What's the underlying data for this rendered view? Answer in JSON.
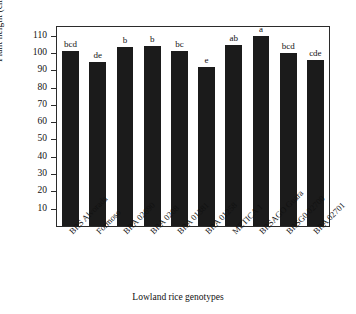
{
  "chart_data": {
    "type": "bar",
    "title": "",
    "xlabel": "Lowland rice genotypes",
    "ylabel": "Plant height (cm)",
    "ylim": [
      0,
      115
    ],
    "yticks": [
      10,
      20,
      30,
      40,
      50,
      60,
      70,
      80,
      90,
      100,
      110
    ],
    "grid": false,
    "legend": "none",
    "bar_color": "#1b1b1b",
    "categories": [
      "BRS Alvorada",
      "Formoso",
      "BRA 02690",
      "BRA 0208",
      "BRA 01381",
      "BRA 01258",
      "METICA 1",
      "BRSAGO Guara",
      "BRSG0 02700",
      "BRA 02701"
    ],
    "values": [
      101,
      95,
      103.5,
      104,
      101,
      92,
      104.5,
      110,
      100,
      96
    ],
    "annotations": [
      "bcd",
      "de",
      "b",
      "b",
      "bc",
      "e",
      "ab",
      "a",
      "bcd",
      "cde"
    ]
  }
}
